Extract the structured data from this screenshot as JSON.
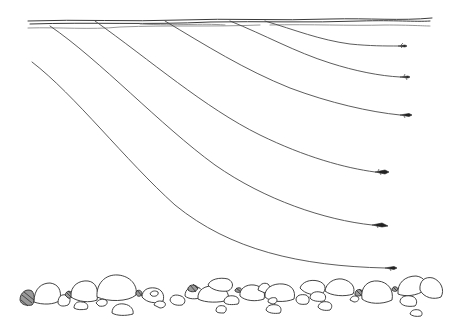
{
  "illustration": {
    "title": "Fly line sink depths through water column",
    "colors": {
      "ink": "#3a3a3a",
      "background": "#ffffff",
      "rock_shade": "#9a9a9a"
    },
    "water_surface": {
      "x_start": 28,
      "x_end": 432,
      "y": 22
    },
    "lines": [
      {
        "id": "line-1",
        "start": [
          265,
          22
        ],
        "end": [
          398,
          46
        ],
        "fly": "fly-icon"
      },
      {
        "id": "line-2",
        "start": [
          230,
          22
        ],
        "end": [
          400,
          77
        ],
        "fly": "fly-icon"
      },
      {
        "id": "line-3",
        "start": [
          165,
          22
        ],
        "end": [
          400,
          115
        ],
        "fly": "fly-icon"
      },
      {
        "id": "line-4",
        "start": [
          95,
          22
        ],
        "end": [
          375,
          172
        ],
        "fly": "fly-icon"
      },
      {
        "id": "line-5",
        "start": [
          50,
          26
        ],
        "end": [
          372,
          225
        ],
        "fly": "fly-icon"
      },
      {
        "id": "line-6",
        "start": [
          32,
          62
        ],
        "end": [
          385,
          268
        ],
        "fly": "fly-icon"
      }
    ],
    "riverbed": {
      "y_top": 272,
      "y_bottom": 320,
      "rock_count": 40
    }
  }
}
